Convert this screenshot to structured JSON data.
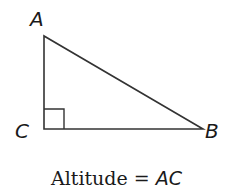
{
  "diagram": {
    "type": "right-triangle",
    "vertices": {
      "A": {
        "label": "A",
        "x": 44,
        "y": 36
      },
      "C": {
        "label": "C",
        "x": 44,
        "y": 129
      },
      "B": {
        "label": "B",
        "x": 203,
        "y": 129
      }
    },
    "right_angle_at": "C",
    "stroke_color": "#333333"
  },
  "caption": {
    "prefix": "Altitude = ",
    "segment": "AC"
  }
}
